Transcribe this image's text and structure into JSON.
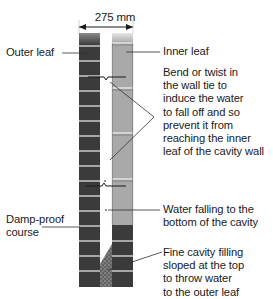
{
  "diagram": {
    "type": "cavity-wall-cross-section",
    "dimension": {
      "label": "275 mm"
    },
    "labels": {
      "outer_leaf": "Outer leaf",
      "inner_leaf": "Inner leaf",
      "wall_tie": "Bend or twist in\nthe wall tie to\ninduce the water\nto fall off and so\nprevent it from\nreaching the inner\nleaf of the cavity wall",
      "water": "Water falling to the\nbottom of the cavity",
      "dpc": "Damp-proof\ncourse",
      "cavity_fill": "Fine cavity filling\nsloped at the top\nto throw water\nto the outer leaf"
    },
    "colors": {
      "outer_brick": "#3b3b3b",
      "inner_block": "#a9a9a9",
      "inner_brick": "#3b3b3b",
      "mortar": "#ffffff",
      "cavity_fill": "#5a5a5a",
      "leader": "#333333"
    }
  }
}
